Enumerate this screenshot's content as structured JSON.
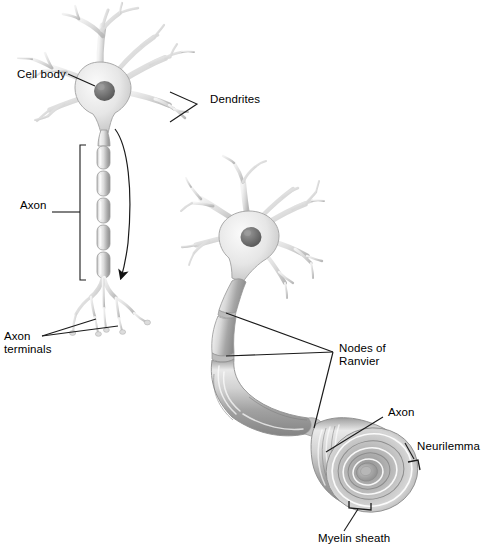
{
  "figure": {
    "type": "biological-illustration",
    "background_color": "#ffffff",
    "ink_color": "#000000",
    "palette": {
      "cell_light": "#f0f0f0",
      "cell_mid": "#d5d5d5",
      "cell_shade": "#b4b4b4",
      "cell_dark": "#8f8f8f",
      "nucleus": "#6e6e6e",
      "outline": "#8a8a8a",
      "myelin_light": "#ededed",
      "myelin_mid": "#c8c8c8",
      "myelin_dark": "#9a9a9a"
    }
  },
  "labels": {
    "cell_body": "Cell body",
    "dendrites": "Dendrites",
    "axon_left": "Axon",
    "axon_terminals": "Axon\nterminals",
    "nodes_of_ranvier": "Nodes of\nRanvier",
    "axon_right": "Axon",
    "neurilemma": "Neurilemma",
    "myelin_sheath": "Myelin sheath"
  },
  "neurons": [
    {
      "name": "unmyelinated-schematic-neuron",
      "position": "upper-left",
      "parts": [
        "dendrites",
        "cell body",
        "nucleus",
        "axon",
        "axon terminals"
      ],
      "impulse_arrow": "downward along axon"
    },
    {
      "name": "myelinated-neuron",
      "position": "right",
      "parts": [
        "dendrites",
        "cell body",
        "nucleus",
        "myelinated axon",
        "nodes of Ranvier",
        "cut-away myelin sheath",
        "neurilemma"
      ],
      "node_count": 3
    }
  ]
}
